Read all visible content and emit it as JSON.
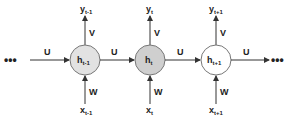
{
  "diagram": {
    "ellipsis_left": "•••",
    "ellipsis_right": "•••",
    "edge_labels": {
      "recurrent": "U",
      "output": "V",
      "input": "W"
    },
    "nodes": [
      {
        "id": "h_prev",
        "label_main": "h",
        "label_sub": "t-1",
        "fill": "#e2e2e2",
        "output_main": "y",
        "output_sub": "t-1",
        "input_main": "x",
        "input_sub": "t-1"
      },
      {
        "id": "h_curr",
        "label_main": "h",
        "label_sub": "t",
        "fill": "#cfcfcf",
        "output_main": "y",
        "output_sub": "t",
        "input_main": "x",
        "input_sub": "t"
      },
      {
        "id": "h_next",
        "label_main": "h",
        "label_sub": "t+1",
        "fill": "#ffffff",
        "output_main": "y",
        "output_sub": "t+1",
        "input_main": "x",
        "input_sub": "t+1"
      }
    ]
  }
}
